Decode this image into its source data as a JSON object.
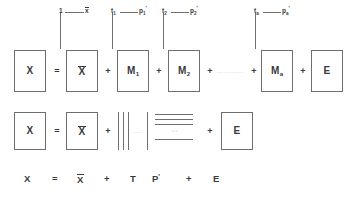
{
  "figure": {
    "kind": "equation-diagram",
    "colors": {
      "background": "#ffffff",
      "stroke": "#6e6e6e",
      "text": "#3a3a3a",
      "dots": "#9a9a9a"
    }
  },
  "annotations": [
    {
      "left_symbol": "1",
      "right_symbol": "x",
      "right_overbar": true,
      "right_sub": "",
      "right_sup": ""
    },
    {
      "left_symbol": "t",
      "left_sub": "1",
      "right_symbol": "p",
      "right_sub": "1",
      "right_sup": "′"
    },
    {
      "left_symbol": "t",
      "left_sub": "2",
      "right_symbol": "p",
      "right_sub": "2",
      "right_sup": "′"
    },
    {
      "left_symbol": "t",
      "left_sub": "a",
      "right_symbol": "p",
      "right_sub": "a",
      "right_sup": "′"
    }
  ],
  "row1": {
    "name": "expanded-component-sum",
    "terms": [
      {
        "type": "box",
        "label": "X",
        "sub": "",
        "overbar": false
      },
      {
        "type": "op",
        "label": "="
      },
      {
        "type": "box",
        "label": "X",
        "sub": "",
        "overbar": true
      },
      {
        "type": "op",
        "label": "+"
      },
      {
        "type": "box",
        "label": "M",
        "sub": "1",
        "overbar": false
      },
      {
        "type": "op",
        "label": "+"
      },
      {
        "type": "box",
        "label": "M",
        "sub": "2",
        "overbar": false
      },
      {
        "type": "op",
        "label": "+"
      },
      {
        "type": "ellipsis",
        "label": "···········"
      },
      {
        "type": "op",
        "label": "+"
      },
      {
        "type": "box",
        "label": "M",
        "sub": "a",
        "overbar": false
      },
      {
        "type": "op",
        "label": "+"
      },
      {
        "type": "box",
        "label": "E",
        "sub": "",
        "overbar": false
      }
    ]
  },
  "row2": {
    "name": "score-loading-vector-form",
    "x_label": "X",
    "equals": "=",
    "xbar_label": "X",
    "plus_1": "+",
    "score_vectors_count": 4,
    "score_vectors_ellipsis": "····",
    "loading_rows_count": 4,
    "loading_rows_ellipsis": "⋮",
    "plus_2": "+",
    "e_label": "E"
  },
  "row3": {
    "name": "compact-matrix-form",
    "tokens": [
      {
        "label": "X",
        "overbar": false,
        "sup": ""
      },
      {
        "label": "=",
        "overbar": false,
        "sup": ""
      },
      {
        "label": "X",
        "overbar": true,
        "sup": ""
      },
      {
        "label": "+",
        "overbar": false,
        "sup": ""
      },
      {
        "label": "T",
        "overbar": false,
        "sup": ""
      },
      {
        "label": "P",
        "overbar": false,
        "sup": "′"
      },
      {
        "label": "+",
        "overbar": false,
        "sup": ""
      },
      {
        "label": "E",
        "overbar": false,
        "sup": ""
      }
    ]
  }
}
